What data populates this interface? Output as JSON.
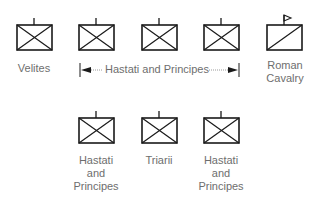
{
  "diagram": {
    "type": "military-formation",
    "symbol_color": "#1a1a1a",
    "label_color": "#6e6e6e",
    "front_row": [
      {
        "symbol": "infantry-x-box",
        "label": "Velites"
      },
      {
        "symbol": "infantry-x-box",
        "label": ""
      },
      {
        "symbol": "infantry-x-box",
        "label": ""
      },
      {
        "symbol": "infantry-x-box",
        "label": ""
      },
      {
        "symbol": "cavalry-slash-box-flag",
        "label_line1": "Roman",
        "label_line2": "Cavalry"
      }
    ],
    "span_label": "Hastati and Principes",
    "back_row": [
      {
        "symbol": "infantry-x-box",
        "label_line1": "Hastati",
        "label_line2": "and",
        "label_line3": "Principes"
      },
      {
        "symbol": "infantry-x-box",
        "label": "Triarii"
      },
      {
        "symbol": "infantry-x-box",
        "label_line1": "Hastati",
        "label_line2": "and",
        "label_line3": "Principes"
      }
    ]
  }
}
